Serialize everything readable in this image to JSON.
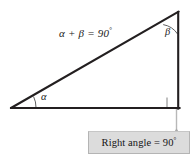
{
  "figure": {
    "type": "geometry-diagram",
    "background_color": "#ffffff",
    "stroke_color": "#231f20",
    "arc_color": "#5a5a5a",
    "connector_color": "#b0b0b0",
    "triangle": {
      "vertices": {
        "bottom_left": {
          "x": 11,
          "y": 108
        },
        "bottom_right": {
          "x": 179,
          "y": 108
        },
        "top_right": {
          "x": 178,
          "y": 12
        }
      },
      "sides": {
        "base_label": "",
        "vertical_label": "",
        "hypotenuse_label": ""
      }
    },
    "angles": {
      "alpha": {
        "symbol": "α",
        "vertex": "bottom_left",
        "marked": "arc"
      },
      "beta": {
        "symbol": "β",
        "vertex": "top_right",
        "marked": "arc"
      },
      "right": {
        "symbol": "",
        "vertex": "bottom_right",
        "marked": "square"
      }
    },
    "equation": {
      "text": "α + β = 90",
      "degree_symbol": "°"
    },
    "callout": {
      "text": "Right angle = 90",
      "degree_symbol": "°",
      "fill_color": "#dcdcdc",
      "border_color": "#b4b4b4",
      "pointer": "arrowhead-up"
    }
  }
}
